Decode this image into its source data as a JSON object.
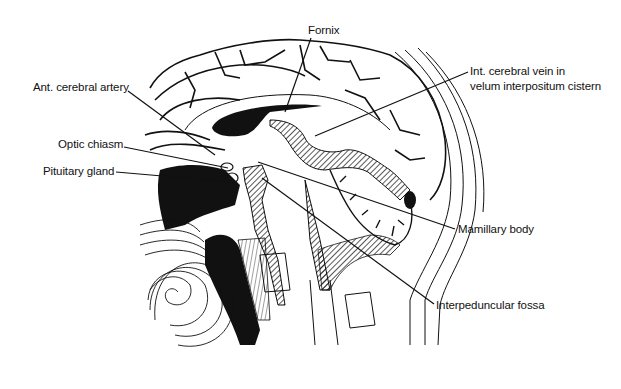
{
  "figure": {
    "background": "#ffffff",
    "ink": "#111111",
    "labels": [
      {
        "id": "fornix",
        "text": "Fornix",
        "x": 308,
        "y": 24,
        "line_from": [
          311,
          38
        ],
        "line_to": [
          285,
          112
        ]
      },
      {
        "id": "int-cerebral-vein",
        "text": "Int. cerebral vein in",
        "text2": "velum interpositum cistern",
        "x": 470,
        "y": 66,
        "line_from": [
          468,
          72
        ],
        "line_to": [
          315,
          136
        ]
      },
      {
        "id": "ant-cerebral-artery",
        "text": "Ant. cerebral artery",
        "x": 34,
        "y": 80,
        "line_from": [
          128,
          91
        ],
        "line_to": [
          215,
          155
        ]
      },
      {
        "id": "optic-chiasm",
        "text": "Optic chiasm",
        "x": 58,
        "y": 137,
        "line_from": [
          124,
          147
        ],
        "line_to": [
          228,
          168
        ]
      },
      {
        "id": "pituitary-gland",
        "text": "Pituitary gland",
        "x": 42,
        "y": 165,
        "line_from": [
          116,
          172
        ],
        "line_to": [
          232,
          182
        ]
      },
      {
        "id": "mamillary-body",
        "text": "Mamillary body",
        "x": 458,
        "y": 222,
        "line_from": [
          455,
          229
        ],
        "line_to": [
          258,
          162
        ]
      },
      {
        "id": "interpeduncular-fossa",
        "text": "Interpeduncular fossa",
        "x": 436,
        "y": 298,
        "line_from": [
          434,
          304
        ],
        "line_to": [
          262,
          178
        ]
      }
    ]
  }
}
